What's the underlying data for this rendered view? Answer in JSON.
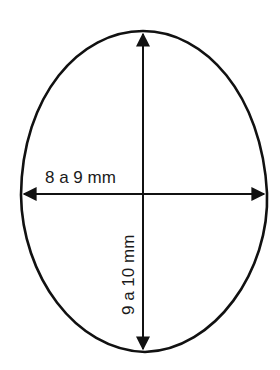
{
  "diagram": {
    "shape": "egg-outline",
    "stroke_color": "#111111",
    "background": "#ffffff",
    "width_label": "8 a 9 mm",
    "height_label": "9 a 10 mm"
  }
}
